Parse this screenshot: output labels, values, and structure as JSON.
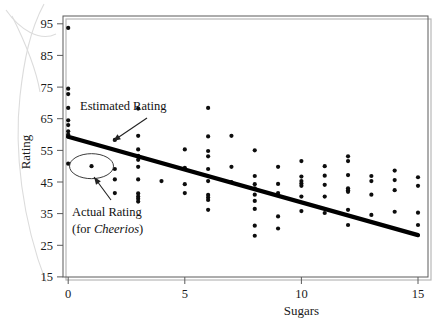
{
  "figure": {
    "name": "sugars-vs-rating-scatterplot"
  },
  "chart_data": {
    "type": "scatter",
    "title": "",
    "xlabel": "Sugars",
    "ylabel": "Rating",
    "xlim": [
      -0.75,
      15.75
    ],
    "ylim": [
      13,
      98
    ],
    "xticks": [
      0,
      5,
      10,
      15
    ],
    "xtick_labels": [
      "0",
      "5",
      "10",
      "15"
    ],
    "yticks": [
      15,
      25,
      35,
      45,
      55,
      65,
      75,
      85,
      95
    ],
    "ytick_labels": [
      "15",
      "25",
      "35",
      "45",
      "55",
      "65",
      "75",
      "85",
      "95"
    ],
    "grid": false,
    "legend": null,
    "point_color": "#0d0d0d",
    "line_color": "#000000",
    "series": [
      {
        "name": "Cereals",
        "points": [
          [
            0,
            93.7
          ],
          [
            0,
            74.5
          ],
          [
            0,
            72.8
          ],
          [
            0,
            68.4
          ],
          [
            0,
            64.5
          ],
          [
            0,
            63.0
          ],
          [
            0,
            61.0
          ],
          [
            0,
            60.0
          ],
          [
            0,
            59.4
          ],
          [
            0,
            50.8
          ],
          [
            1,
            50.0
          ],
          [
            2,
            58.3
          ],
          [
            2,
            49.1
          ],
          [
            2,
            45.8
          ],
          [
            2,
            41.5
          ],
          [
            3,
            68.2
          ],
          [
            3,
            59.6
          ],
          [
            3,
            55.3
          ],
          [
            3,
            53.3
          ],
          [
            3,
            52.0
          ],
          [
            3,
            49.8
          ],
          [
            3,
            45.8
          ],
          [
            3,
            41.4
          ],
          [
            3,
            40.4
          ],
          [
            3,
            39.7
          ],
          [
            3,
            38.8
          ],
          [
            4,
            45.3
          ],
          [
            5,
            55.3
          ],
          [
            5,
            49.5
          ],
          [
            5,
            44.3
          ],
          [
            5,
            41.5
          ],
          [
            6,
            68.4
          ],
          [
            6,
            59.4
          ],
          [
            6,
            54.8
          ],
          [
            6,
            53.1
          ],
          [
            6,
            49.1
          ],
          [
            6,
            45.3
          ],
          [
            6,
            40.9
          ],
          [
            6,
            40.1
          ],
          [
            6,
            39.3
          ],
          [
            6,
            36.2
          ],
          [
            7,
            59.6
          ],
          [
            7,
            49.8
          ],
          [
            7,
            45.0
          ],
          [
            8,
            55.0
          ],
          [
            8,
            46.9
          ],
          [
            8,
            44.3
          ],
          [
            8,
            43.0
          ],
          [
            8,
            41.0
          ],
          [
            8,
            39.0
          ],
          [
            8,
            36.5
          ],
          [
            8,
            31.2
          ],
          [
            8,
            28.0
          ],
          [
            9,
            49.8
          ],
          [
            9,
            44.4
          ],
          [
            9,
            41.5
          ],
          [
            9,
            34.1
          ],
          [
            9,
            30.3
          ],
          [
            10,
            51.6
          ],
          [
            10,
            46.7
          ],
          [
            10,
            45.3
          ],
          [
            10,
            44.5
          ],
          [
            10,
            43.8
          ],
          [
            10,
            40.4
          ],
          [
            10,
            35.8
          ],
          [
            11,
            50.0
          ],
          [
            11,
            47.0
          ],
          [
            11,
            44.1
          ],
          [
            11,
            40.4
          ],
          [
            11,
            35.2
          ],
          [
            12,
            53.1
          ],
          [
            12,
            51.6
          ],
          [
            12,
            47.2
          ],
          [
            12,
            43.0
          ],
          [
            12,
            42.4
          ],
          [
            12,
            41.9
          ],
          [
            12,
            36.2
          ],
          [
            12,
            31.4
          ],
          [
            13,
            46.9
          ],
          [
            13,
            45.3
          ],
          [
            13,
            41.0
          ],
          [
            13,
            34.6
          ],
          [
            14,
            48.6
          ],
          [
            14,
            45.6
          ],
          [
            14,
            42.4
          ],
          [
            14,
            35.6
          ],
          [
            15,
            46.5
          ],
          [
            15,
            43.8
          ],
          [
            15,
            35.3
          ],
          [
            15,
            31.4
          ]
        ]
      }
    ],
    "fit_line": {
      "name": "Estimated Rating (least-squares regression line)",
      "x0": 0,
      "y0": 59.3,
      "x1": 15,
      "y1": 28.2,
      "intercept": 59.3,
      "slope": -2.07
    },
    "annotations": [
      {
        "id": "estimated-rating",
        "label": "Estimated Rating",
        "text_x": 80,
        "text_y": 110,
        "arrow_from_x": 147,
        "arrow_from_y": 118,
        "arrow_to_x": 113,
        "arrow_to_y": 141
      },
      {
        "id": "actual-rating",
        "label_line1": "Actual Rating",
        "label_line2_prefix": "(for ",
        "label_line2_italic": "Cheerios",
        "label_line2_suffix": ")",
        "text_x": 72,
        "text_y": 216,
        "highlight_point": [
          1,
          50.0
        ],
        "arrow_from_x": 111,
        "arrow_from_y": 200,
        "arrow_to_x": 94,
        "arrow_to_y": 177
      }
    ]
  }
}
